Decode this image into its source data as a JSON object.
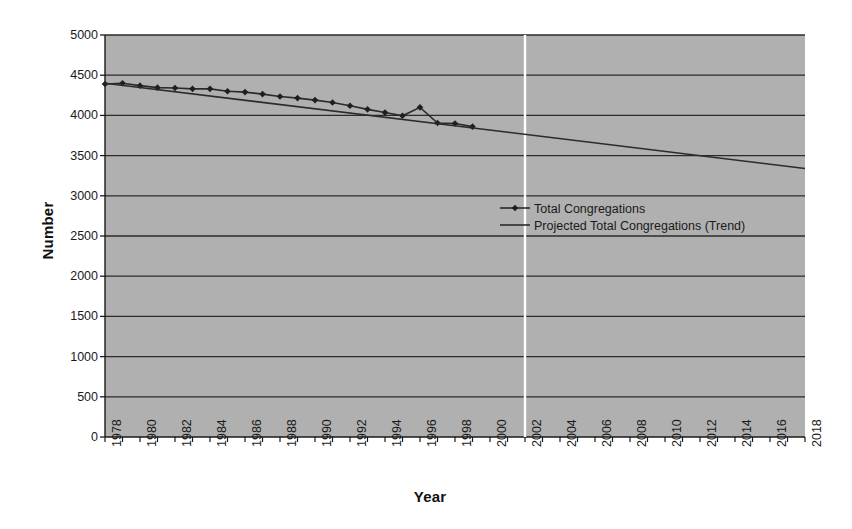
{
  "chart_data": {
    "type": "line",
    "title": "",
    "xlabel": "Year",
    "ylabel": "Number",
    "xlim": [
      1978,
      2018
    ],
    "ylim": [
      0,
      5000
    ],
    "ytick_step": 500,
    "xtick_step": 2,
    "grid": "horizontal",
    "legend_position": "center",
    "plot_background": "#b0b0b0",
    "line_color": "#2b2b2b",
    "marker": "diamond",
    "yticks": [
      0,
      500,
      1000,
      1500,
      2000,
      2500,
      3000,
      3500,
      4000,
      4500,
      5000
    ],
    "xticks": [
      1978,
      1980,
      1982,
      1984,
      1986,
      1988,
      1990,
      1992,
      1994,
      1996,
      1998,
      2000,
      2002,
      2004,
      2006,
      2008,
      2010,
      2012,
      2014,
      2016,
      2018
    ],
    "annotations": [
      {
        "name": "projection-divider",
        "type": "vline",
        "x": 2002,
        "color": "#ffffff"
      }
    ],
    "series": [
      {
        "name": "Total Congregations",
        "legend_label": "Total Congregations",
        "marker": "diamond",
        "x": [
          1978,
          1979,
          1980,
          1981,
          1982,
          1983,
          1984,
          1985,
          1986,
          1987,
          1988,
          1989,
          1990,
          1991,
          1992,
          1993,
          1994,
          1995,
          1996,
          1997,
          1998,
          1999
        ],
        "values": [
          4390,
          4400,
          4370,
          4345,
          4340,
          4330,
          4330,
          4300,
          4290,
          4265,
          4235,
          4215,
          4190,
          4160,
          4120,
          4075,
          4035,
          3995,
          4100,
          3905,
          3900,
          3860
        ]
      },
      {
        "name": "Projected Total Congregations (Trend)",
        "legend_label": "Projected Total Congregations (Trend)",
        "marker": "none",
        "x": [
          1978,
          2018
        ],
        "values": [
          4400,
          3340
        ]
      }
    ]
  },
  "legend": {
    "items": [
      {
        "label": "Total Congregations",
        "symbol": "line-with-diamond-marker"
      },
      {
        "label": "Projected Total Congregations (Trend)",
        "symbol": "line"
      }
    ]
  }
}
